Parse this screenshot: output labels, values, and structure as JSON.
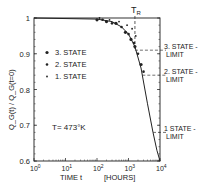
{
  "chart_data": {
    "type": "scatter",
    "title": "",
    "xlabel": "TIME  t",
    "xunit": "[HOURS]",
    "ylabel": "Q_G(t) / Q_G(t=0)",
    "xscale": "log",
    "xlim": [
      1,
      10000
    ],
    "ylim": [
      0.6,
      1.0
    ],
    "x_ticks": [
      "10^0",
      "10^1",
      "10^2",
      "10^3",
      "10^4"
    ],
    "y_ticks": [
      "0.6",
      "0.7",
      "0.8",
      "0.9",
      "1"
    ],
    "grid": false,
    "annotation": "T= 473°K",
    "tr_label": "T_R",
    "tr_x": 1600,
    "legend": {
      "position": "inside-left",
      "entries": [
        "3. STATE",
        "2. STATE",
        "1. STATE"
      ]
    },
    "limits": [
      {
        "name": "3. STATE-LIMIT",
        "line1": "3. STATE -",
        "line2": "LIMIT",
        "y": 0.91
      },
      {
        "name": "2. STATE-LIMIT",
        "line1": "2. STATE -",
        "line2": "LIMIT",
        "y": 0.84
      },
      {
        "name": "1. STATE-LIMIT",
        "line1": "1 STATE -",
        "line2": "LIMIT",
        "y": 0.68
      }
    ],
    "series": [
      {
        "name": "3. STATE",
        "points": [
          [
            100,
            0.995
          ],
          [
            200,
            0.99
          ],
          [
            400,
            0.985
          ],
          [
            800,
            0.96
          ],
          [
            1200,
            0.94
          ],
          [
            1600,
            0.92
          ],
          [
            2500,
            0.87
          ]
        ]
      },
      {
        "name": "2. STATE",
        "points": [
          [
            150,
            0.995
          ],
          [
            300,
            0.985
          ],
          [
            600,
            0.975
          ],
          [
            1000,
            0.955
          ],
          [
            1500,
            0.93
          ],
          [
            2000,
            0.9
          ],
          [
            3000,
            0.85
          ]
        ]
      },
      {
        "name": "1. STATE",
        "points": [
          [
            120,
            1.0
          ],
          [
            250,
            0.995
          ],
          [
            500,
            0.99
          ],
          [
            900,
            0.98
          ],
          [
            1300,
            0.97
          ],
          [
            1700,
            0.95
          ]
        ]
      }
    ],
    "fit_curve": [
      [
        1,
        1.0
      ],
      [
        100,
        0.997
      ],
      [
        300,
        0.99
      ],
      [
        600,
        0.975
      ],
      [
        1000,
        0.955
      ],
      [
        1600,
        0.92
      ],
      [
        2500,
        0.86
      ],
      [
        4000,
        0.76
      ],
      [
        6000,
        0.68
      ],
      [
        8000,
        0.63
      ],
      [
        10000,
        0.6
      ]
    ]
  }
}
